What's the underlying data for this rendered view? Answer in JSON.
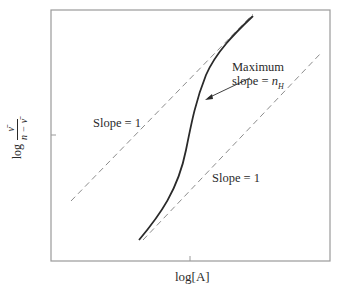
{
  "figure": {
    "xlabel": "log[A]",
    "ylabel": {
      "prefix": "log",
      "numerator": "ν̄",
      "denominator": "n − ν̄"
    },
    "annotations": [
      {
        "id": "slope-upper",
        "text": "Slope = 1"
      },
      {
        "id": "slope-lower",
        "text": "Slope = 1"
      },
      {
        "id": "max-slope-line1",
        "text": "Maximum"
      },
      {
        "id": "max-slope-line2-prefix",
        "text": "slope = "
      },
      {
        "id": "max-slope-var",
        "text": "n"
      },
      {
        "id": "max-slope-sub",
        "text": "H"
      }
    ],
    "colors": {
      "frame": "#9a9a9a",
      "curve": "#2a2a2a",
      "dashed": "#8c8c8c",
      "text": "#2a2a2a"
    }
  }
}
